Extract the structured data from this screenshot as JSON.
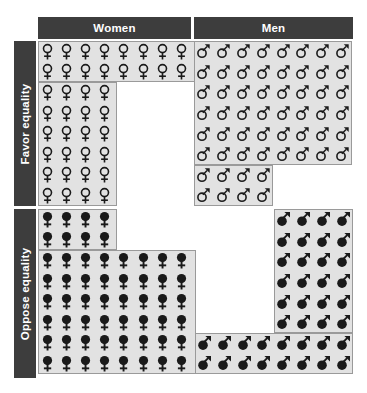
{
  "chart_data": {
    "type": "pictogram",
    "title": "",
    "subtitle": "",
    "xlabel": "",
    "ylabel": "",
    "unit_note": "Each symbol represents 1 person out of 100",
    "grid_columns": 8,
    "grid_rows": 8,
    "cell_total": 100,
    "column_categories": [
      "Women",
      "Men"
    ],
    "row_categories": [
      "Favor equality",
      "Oppose equality"
    ],
    "legend": [
      {
        "key": "women-favor",
        "symbol": "venus-outline",
        "label": "Women who favor equality"
      },
      {
        "key": "men-favor",
        "symbol": "mars-outline",
        "label": "Men who favor equality"
      },
      {
        "key": "women-oppose",
        "symbol": "venus-filled",
        "label": "Women who oppose equality"
      },
      {
        "key": "men-oppose",
        "symbol": "mars-filled",
        "label": "Men who oppose equality"
      }
    ],
    "cells": [
      {
        "key": "women-favor",
        "column": "Women",
        "row": "Favor equality",
        "value": 40,
        "percent": 40,
        "symbol": "venus-outline"
      },
      {
        "key": "men-favor",
        "column": "Men",
        "row": "Favor equality",
        "value": 56,
        "percent": 56,
        "symbol": "mars-outline"
      },
      {
        "key": "women-oppose",
        "column": "Women",
        "row": "Oppose equality",
        "value": 56,
        "percent": 56,
        "symbol": "venus-filled"
      },
      {
        "key": "men-oppose",
        "column": "Men",
        "row": "Oppose equality",
        "value": 40,
        "percent": 40,
        "symbol": "mars-filled"
      }
    ],
    "series": [
      {
        "name": "Favor equality",
        "categories": [
          "Women",
          "Men"
        ],
        "values": [
          40,
          56
        ]
      },
      {
        "name": "Oppose equality",
        "categories": [
          "Women",
          "Men"
        ],
        "values": [
          56,
          40
        ]
      }
    ],
    "row_layouts": {
      "women-favor": {
        "align": "left",
        "counts": [
          8,
          8,
          4,
          4,
          4,
          4,
          4,
          4
        ]
      },
      "men-favor": {
        "align": "left",
        "counts": [
          8,
          8,
          8,
          8,
          8,
          8,
          4,
          4
        ]
      },
      "women-oppose": {
        "align": "left",
        "counts": [
          4,
          4,
          8,
          8,
          8,
          8,
          8,
          8
        ]
      },
      "men-oppose": {
        "align": "right",
        "counts": [
          4,
          4,
          4,
          4,
          4,
          4,
          8,
          8
        ]
      }
    }
  },
  "headers": {
    "women": "Women",
    "men": "Men"
  },
  "row_labels": {
    "favor": "Favor equality",
    "oppose": "Oppose equality"
  },
  "colors": {
    "header_background": "#3d3d3d",
    "header_text": "#ffffff",
    "panel_background": "#e2e2e2",
    "panel_border": "#9a9a9a",
    "glyph": "#1a1a1a",
    "page_background": "#ffffff"
  }
}
